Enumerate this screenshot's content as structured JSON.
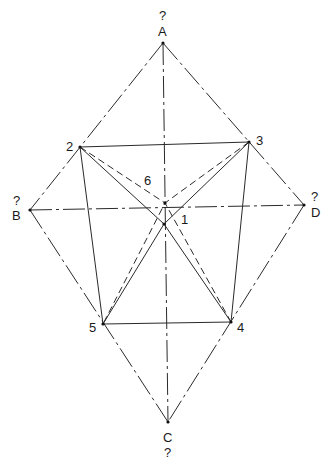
{
  "diagram": {
    "title": "",
    "outer_points": {
      "A": {
        "label": "A",
        "question": "?",
        "x": 163,
        "y": 43
      },
      "B": {
        "label": "B",
        "question": "?",
        "x": 30,
        "y": 210
      },
      "C": {
        "label": "C",
        "question": "?",
        "x": 168,
        "y": 422
      },
      "D": {
        "label": "D",
        "question": "?",
        "x": 304,
        "y": 205
      }
    },
    "inner_points": {
      "p1": {
        "label": "1",
        "x": 164,
        "y": 224
      },
      "p2": {
        "label": "2",
        "x": 80,
        "y": 147
      },
      "p3": {
        "label": "3",
        "x": 249,
        "y": 142
      },
      "p4": {
        "label": "4",
        "x": 231,
        "y": 322
      },
      "p5": {
        "label": "5",
        "x": 103,
        "y": 324
      },
      "p6": {
        "label": "6",
        "x": 165,
        "y": 203
      }
    },
    "edges": [
      {
        "from": "A",
        "to": "B",
        "style": "dash-dot"
      },
      {
        "from": "A",
        "to": "D",
        "style": "dash-dot"
      },
      {
        "from": "B",
        "to": "C",
        "style": "dash-dot"
      },
      {
        "from": "D",
        "to": "C",
        "style": "dash-dot"
      },
      {
        "from": "A",
        "to": "C",
        "style": "dash-dot"
      },
      {
        "from": "B",
        "to": "D",
        "style": "dash-dot"
      },
      {
        "from": "2",
        "to": "3",
        "style": "solid"
      },
      {
        "from": "5",
        "to": "4",
        "style": "solid"
      },
      {
        "from": "2",
        "to": "5",
        "style": "solid"
      },
      {
        "from": "3",
        "to": "4",
        "style": "solid"
      },
      {
        "from": "2",
        "to": "4",
        "via": "1",
        "style": "solid"
      },
      {
        "from": "3",
        "to": "5",
        "via": "1",
        "style": "solid"
      },
      {
        "from": "2",
        "to": "4",
        "via": "6",
        "style": "dashed"
      },
      {
        "from": "3",
        "to": "5",
        "via": "6",
        "style": "dashed"
      }
    ]
  },
  "labels": {
    "A": "A",
    "B": "B",
    "C": "C",
    "D": "D",
    "qA": "?",
    "qB": "?",
    "qC": "?",
    "qD": "?",
    "n1": "1",
    "n2": "2",
    "n3": "3",
    "n4": "4",
    "n5": "5",
    "n6": "6"
  }
}
